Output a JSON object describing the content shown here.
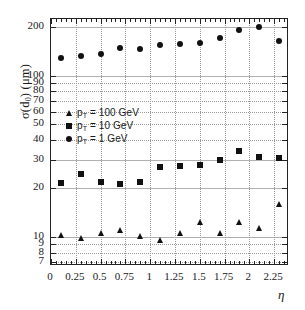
{
  "chart_data": {
    "type": "scatter",
    "title": "",
    "subtitle": "",
    "xlabel": "η",
    "ylabel": "σ(d₀) (μm)",
    "ylabel_parts": {
      "sigma": "σ(d",
      "sub": "0",
      "tail": ") (μm)"
    },
    "xlim": [
      0,
      2.4
    ],
    "ylim": [
      6.6,
      225
    ],
    "yscale": "log",
    "xscale": "linear",
    "grid": true,
    "legend_position": "center-left",
    "x": [
      0.1,
      0.3,
      0.5,
      0.7,
      0.9,
      1.1,
      1.3,
      1.5,
      1.7,
      1.9,
      2.1,
      2.3
    ],
    "series": [
      {
        "name": "p_T = 100 GeV",
        "label": "p",
        "label_sub": "T",
        "label_tail": " = 100 GeV",
        "marker": "triangle",
        "color": "#111111",
        "values": [
          10.2,
          9.8,
          10.5,
          11.0,
          10.1,
          9.6,
          10.6,
          12.3,
          10.5,
          12.3,
          11.3,
          16.0
        ]
      },
      {
        "name": "p_T = 10 GeV",
        "label": "p",
        "label_sub": "T",
        "label_tail": " = 10 GeV",
        "marker": "square",
        "color": "#111111",
        "values": [
          21.5,
          24.5,
          22.0,
          21.3,
          22.0,
          27.0,
          27.5,
          27.8,
          30.2,
          34.0,
          31.5,
          31.0
        ]
      },
      {
        "name": "p_T = 1 GeV",
        "label": "p",
        "label_sub": "T",
        "label_tail": " = 1 GeV",
        "marker": "circle",
        "color": "#111111",
        "values": [
          128,
          133,
          137,
          148,
          147,
          155,
          157,
          160,
          172,
          192,
          201,
          165
        ]
      }
    ],
    "ytick_labels": [
      "200",
      "100",
      "90",
      "80",
      "70",
      "60",
      "50",
      "40",
      "30",
      "20",
      "10",
      "9",
      "8",
      "7"
    ],
    "ytick_values": [
      200,
      100,
      90,
      80,
      70,
      60,
      50,
      40,
      30,
      20,
      10,
      9,
      8,
      7
    ],
    "xtick_labels": [
      "0",
      "0.25",
      "0.5",
      "0.75",
      "1",
      "1.25",
      "1.5",
      "1.75",
      "2",
      "2.25"
    ],
    "xtick_values": [
      0,
      0.25,
      0.5,
      0.75,
      1,
      1.25,
      1.5,
      1.75,
      2,
      2.25
    ]
  }
}
